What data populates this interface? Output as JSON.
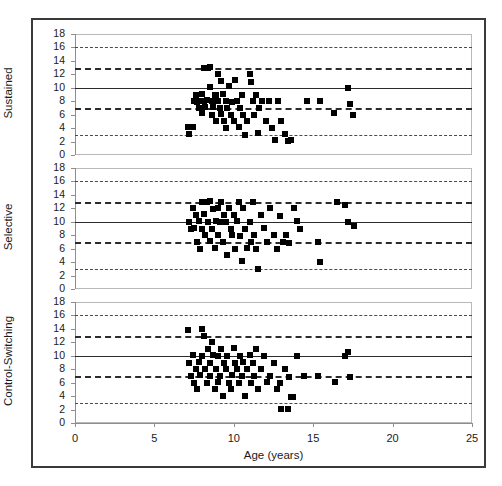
{
  "figure": {
    "width": 502,
    "height": 486,
    "background": "#ffffff",
    "frame_color": "#3a3a3a"
  },
  "chart_data": {
    "type": "scatter",
    "title": "",
    "xlabel": "Age (years)",
    "ylabel": "",
    "xlim": [
      0,
      25
    ],
    "ylim": [
      0,
      18
    ],
    "xticks": [
      0,
      5,
      10,
      15,
      20,
      25
    ],
    "yticks": [
      0,
      2,
      4,
      6,
      8,
      10,
      12,
      14,
      16,
      18
    ],
    "grid": false,
    "legend": "none",
    "marker": "filled-square",
    "marker_color": "#000000",
    "reference_lines": [
      {
        "y": 16,
        "style": "dotted",
        "color": "#4a4a4a"
      },
      {
        "y": 13,
        "style": "dashed",
        "color": "#2b2b2b"
      },
      {
        "y": 10,
        "style": "solid",
        "color": "#2b2b2b"
      },
      {
        "y": 7,
        "style": "dashed",
        "color": "#2b2b2b"
      },
      {
        "y": 3,
        "style": "dotted",
        "color": "#4a4a4a"
      }
    ],
    "panels": [
      {
        "label": "Sustained",
        "points": [
          [
            7.1,
            4.2
          ],
          [
            7.2,
            3.1
          ],
          [
            7.4,
            4.1
          ],
          [
            7.5,
            8.0
          ],
          [
            7.6,
            9.0
          ],
          [
            7.7,
            7.9
          ],
          [
            7.8,
            7.0
          ],
          [
            7.9,
            8.1
          ],
          [
            8.0,
            6.2
          ],
          [
            8.0,
            9.1
          ],
          [
            8.1,
            13.0
          ],
          [
            8.1,
            8.0
          ],
          [
            8.2,
            7.1
          ],
          [
            8.3,
            8.2
          ],
          [
            8.4,
            12.9
          ],
          [
            8.5,
            13.1
          ],
          [
            8.5,
            10.1
          ],
          [
            8.6,
            8.0
          ],
          [
            8.6,
            6.0
          ],
          [
            8.7,
            7.1
          ],
          [
            8.8,
            8.9
          ],
          [
            8.9,
            5.0
          ],
          [
            8.9,
            9.0
          ],
          [
            9.0,
            12.0
          ],
          [
            9.0,
            8.1
          ],
          [
            9.1,
            7.0
          ],
          [
            9.2,
            11.0
          ],
          [
            9.2,
            6.1
          ],
          [
            9.3,
            9.1
          ],
          [
            9.4,
            5.1
          ],
          [
            9.5,
            8.0
          ],
          [
            9.5,
            4.0
          ],
          [
            9.6,
            7.0
          ],
          [
            9.7,
            10.2
          ],
          [
            9.8,
            6.0
          ],
          [
            9.9,
            7.9
          ],
          [
            10.0,
            5.0
          ],
          [
            10.1,
            11.1
          ],
          [
            10.2,
            8.0
          ],
          [
            10.3,
            4.1
          ],
          [
            10.4,
            7.0
          ],
          [
            10.5,
            9.0
          ],
          [
            10.6,
            6.0
          ],
          [
            10.7,
            3.0
          ],
          [
            10.8,
            5.1
          ],
          [
            11.0,
            12.1
          ],
          [
            11.1,
            10.9
          ],
          [
            11.2,
            8.1
          ],
          [
            11.3,
            6.0
          ],
          [
            11.4,
            9.0
          ],
          [
            11.5,
            3.2
          ],
          [
            11.6,
            7.0
          ],
          [
            11.8,
            8.0
          ],
          [
            12.0,
            5.0
          ],
          [
            12.2,
            8.1
          ],
          [
            12.4,
            4.0
          ],
          [
            12.6,
            2.2
          ],
          [
            12.8,
            8.0
          ],
          [
            13.0,
            5.0
          ],
          [
            13.2,
            3.1
          ],
          [
            13.4,
            2.1
          ],
          [
            13.6,
            2.2
          ],
          [
            14.6,
            8.0
          ],
          [
            15.4,
            8.1
          ],
          [
            16.3,
            6.2
          ],
          [
            17.2,
            10.0
          ],
          [
            17.3,
            7.6
          ],
          [
            17.5,
            5.9
          ]
        ]
      },
      {
        "label": "Selective",
        "points": [
          [
            7.2,
            10.0
          ],
          [
            7.3,
            8.9
          ],
          [
            7.4,
            12.1
          ],
          [
            7.5,
            9.1
          ],
          [
            7.6,
            11.0
          ],
          [
            7.7,
            7.0
          ],
          [
            7.8,
            10.1
          ],
          [
            7.9,
            6.0
          ],
          [
            8.0,
            13.0
          ],
          [
            8.0,
            9.0
          ],
          [
            8.1,
            11.1
          ],
          [
            8.2,
            8.0
          ],
          [
            8.3,
            12.9
          ],
          [
            8.4,
            10.0
          ],
          [
            8.5,
            7.1
          ],
          [
            8.5,
            13.1
          ],
          [
            8.6,
            9.0
          ],
          [
            8.7,
            11.9
          ],
          [
            8.8,
            6.1
          ],
          [
            8.9,
            10.1
          ],
          [
            9.0,
            12.0
          ],
          [
            9.0,
            8.0
          ],
          [
            9.1,
            9.9
          ],
          [
            9.2,
            13.0
          ],
          [
            9.3,
            7.0
          ],
          [
            9.4,
            11.0
          ],
          [
            9.5,
            10.0
          ],
          [
            9.6,
            5.0
          ],
          [
            9.7,
            12.1
          ],
          [
            9.8,
            9.0
          ],
          [
            9.9,
            8.1
          ],
          [
            10.0,
            11.0
          ],
          [
            10.1,
            6.0
          ],
          [
            10.2,
            10.1
          ],
          [
            10.3,
            13.0
          ],
          [
            10.4,
            7.9
          ],
          [
            10.5,
            4.1
          ],
          [
            10.6,
            12.0
          ],
          [
            10.7,
            9.0
          ],
          [
            10.8,
            6.1
          ],
          [
            11.0,
            10.0
          ],
          [
            11.1,
            7.0
          ],
          [
            11.2,
            12.9
          ],
          [
            11.3,
            8.0
          ],
          [
            11.4,
            5.9
          ],
          [
            11.5,
            3.0
          ],
          [
            11.7,
            11.0
          ],
          [
            11.9,
            9.1
          ],
          [
            12.1,
            7.0
          ],
          [
            12.3,
            12.0
          ],
          [
            12.5,
            8.0
          ],
          [
            12.7,
            6.0
          ],
          [
            12.9,
            10.9
          ],
          [
            13.1,
            7.0
          ],
          [
            13.3,
            8.1
          ],
          [
            13.5,
            6.9
          ],
          [
            13.8,
            12.0
          ],
          [
            14.0,
            10.1
          ],
          [
            14.2,
            9.0
          ],
          [
            15.3,
            7.0
          ],
          [
            15.4,
            4.0
          ],
          [
            16.5,
            13.0
          ],
          [
            17.0,
            12.5
          ],
          [
            17.2,
            9.9
          ],
          [
            17.6,
            9.3
          ]
        ]
      },
      {
        "label": "Control-Switching",
        "points": [
          [
            7.1,
            13.9
          ],
          [
            7.2,
            9.0
          ],
          [
            7.3,
            7.0
          ],
          [
            7.4,
            10.1
          ],
          [
            7.5,
            6.0
          ],
          [
            7.6,
            8.0
          ],
          [
            7.7,
            5.0
          ],
          [
            7.8,
            9.1
          ],
          [
            7.9,
            7.1
          ],
          [
            8.0,
            14.0
          ],
          [
            8.0,
            10.0
          ],
          [
            8.1,
            13.0
          ],
          [
            8.2,
            8.1
          ],
          [
            8.3,
            6.0
          ],
          [
            8.4,
            11.0
          ],
          [
            8.5,
            9.0
          ],
          [
            8.5,
            7.0
          ],
          [
            8.6,
            12.1
          ],
          [
            8.7,
            10.1
          ],
          [
            8.8,
            5.1
          ],
          [
            8.9,
            8.0
          ],
          [
            9.0,
            9.9
          ],
          [
            9.0,
            6.1
          ],
          [
            9.1,
            7.0
          ],
          [
            9.2,
            11.0
          ],
          [
            9.3,
            4.0
          ],
          [
            9.4,
            9.0
          ],
          [
            9.5,
            8.0
          ],
          [
            9.6,
            10.0
          ],
          [
            9.7,
            6.0
          ],
          [
            9.8,
            5.1
          ],
          [
            9.9,
            7.1
          ],
          [
            10.0,
            11.1
          ],
          [
            10.1,
            9.0
          ],
          [
            10.2,
            8.0
          ],
          [
            10.3,
            6.0
          ],
          [
            10.4,
            10.0
          ],
          [
            10.5,
            7.0
          ],
          [
            10.6,
            9.1
          ],
          [
            10.7,
            4.0
          ],
          [
            10.8,
            8.1
          ],
          [
            11.0,
            10.1
          ],
          [
            11.1,
            6.0
          ],
          [
            11.2,
            9.0
          ],
          [
            11.3,
            7.0
          ],
          [
            11.4,
            11.0
          ],
          [
            11.5,
            5.0
          ],
          [
            11.7,
            8.0
          ],
          [
            11.9,
            9.9
          ],
          [
            12.1,
            6.1
          ],
          [
            12.3,
            7.0
          ],
          [
            12.5,
            9.0
          ],
          [
            12.7,
            5.0
          ],
          [
            12.9,
            6.0
          ],
          [
            13.0,
            2.1
          ],
          [
            13.2,
            8.0
          ],
          [
            13.4,
            2.1
          ],
          [
            13.5,
            6.9
          ],
          [
            13.6,
            3.9
          ],
          [
            13.7,
            3.8
          ],
          [
            14.0,
            10.0
          ],
          [
            14.4,
            7.0
          ],
          [
            15.3,
            7.0
          ],
          [
            16.4,
            6.1
          ],
          [
            17.0,
            9.9
          ],
          [
            17.2,
            10.5
          ],
          [
            17.3,
            6.9
          ]
        ]
      }
    ]
  }
}
